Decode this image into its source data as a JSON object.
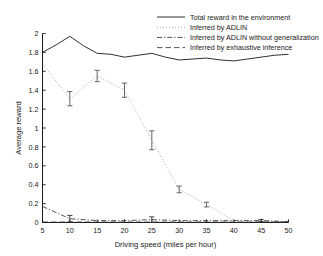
{
  "chart_data": {
    "type": "line",
    "title": "",
    "subtitle": "",
    "xlabel": "Driving speed (miles per hour)",
    "ylabel": "Average reward",
    "xlim": [
      5,
      50
    ],
    "ylim": [
      0,
      2
    ],
    "grid": false,
    "legend_position": "top-right",
    "xticks": [
      5,
      10,
      15,
      20,
      25,
      30,
      35,
      40,
      45,
      50
    ],
    "xticklabels": [
      "5",
      "10",
      "15",
      "20",
      "25",
      "30",
      "35",
      "40",
      "45",
      "50"
    ],
    "yticks": [
      0,
      0.2,
      0.4,
      0.6,
      0.8,
      1,
      1.2,
      1.4,
      1.6,
      1.8,
      2
    ],
    "yticklabels": [
      "0",
      "0.2",
      "0.4",
      "0.6",
      "0.8",
      "1",
      "1.2",
      "1.4",
      "1.6",
      "1.8",
      "2"
    ],
    "x": [
      5,
      10,
      15,
      20,
      25,
      30,
      35,
      40,
      45,
      50
    ],
    "series": [
      {
        "name": "Total reward in the environment",
        "style": "solid",
        "color": "#262626",
        "x": [
          5,
          7.5,
          10,
          12.5,
          15,
          17.5,
          20,
          22.5,
          25,
          27.5,
          30,
          32.5,
          35,
          37.5,
          40,
          42.5,
          45,
          47.5,
          50
        ],
        "values": [
          1.8,
          1.88,
          1.97,
          1.87,
          1.79,
          1.78,
          1.75,
          1.77,
          1.79,
          1.75,
          1.72,
          1.73,
          1.74,
          1.72,
          1.71,
          1.73,
          1.75,
          1.77,
          1.78
        ],
        "errors": []
      },
      {
        "name": "Inferred by ADLIN",
        "style": "dotted",
        "color": "#8c8c8c",
        "x": [
          5,
          10,
          15,
          20,
          25,
          30,
          35,
          40,
          45,
          50
        ],
        "values": [
          1.68,
          1.31,
          1.55,
          1.4,
          0.87,
          0.35,
          0.19,
          0.02,
          0.01,
          0.01
        ],
        "errors": [
          0.0,
          0.075,
          0.06,
          0.075,
          0.1,
          0.035,
          0.025,
          0.0,
          0.0,
          0.0
        ]
      },
      {
        "name": "Inferred by ADLIN without generalization",
        "style": "dashdot",
        "color": "#333333",
        "x": [
          5,
          10,
          15,
          20,
          25,
          30,
          35,
          40,
          45,
          50
        ],
        "values": [
          0.17,
          0.04,
          0.02,
          0.02,
          0.03,
          0.02,
          0.02,
          0.02,
          0.02,
          0.01
        ],
        "errors": [
          0.0,
          0.035,
          0.0,
          0.0,
          0.03,
          0.0,
          0.0,
          0.0,
          0.012,
          0.0
        ]
      },
      {
        "name": "Inferred by exhaustive inference",
        "style": "dashed",
        "color": "#333333",
        "x": [
          5,
          10,
          15,
          20,
          25,
          30,
          35,
          40,
          45,
          50
        ],
        "values": [
          0.005,
          0.005,
          0.005,
          0.005,
          0.005,
          0.005,
          0.005,
          0.005,
          0.005,
          0.005
        ],
        "errors": [
          0.0,
          0.0,
          0.0,
          0.0,
          0.0,
          0.0,
          0.0,
          0.0,
          0.0,
          0.0
        ]
      }
    ]
  },
  "legend": {
    "entries": [
      {
        "label": "Total reward in the environment"
      },
      {
        "label": "Inferred by ADLIN"
      },
      {
        "label": "Inferred by ADLIN without generalization"
      },
      {
        "label": "Inferred by exhaustive inference"
      }
    ]
  },
  "axes": {
    "x_title": "Driving speed (miles per hour)",
    "y_title": "Average reward"
  }
}
